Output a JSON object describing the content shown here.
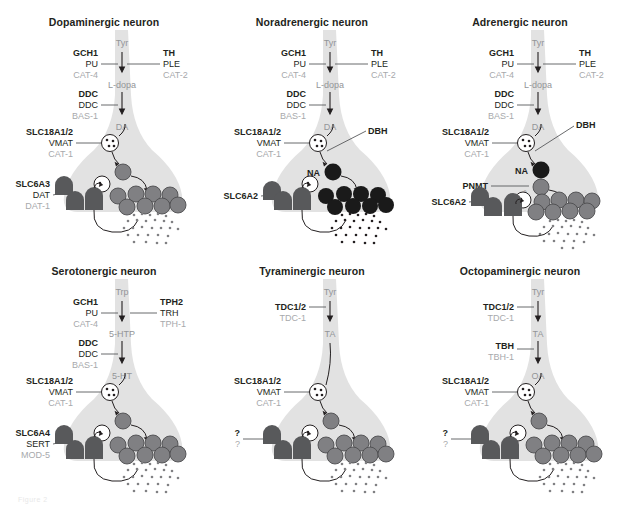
{
  "figure": {
    "caption_fragment": "Figure 2",
    "colors": {
      "neuron_fill": "#e0e0e0",
      "neuron_fill_light": "#e8e8e8",
      "vesicle_gray": "#808083",
      "vesicle_dark": "#1a1a1a",
      "transporter": "#58595b",
      "text_black": "#231f20",
      "text_gray": "#a7a9ac",
      "metabolite_gray": "#939598"
    }
  },
  "panels": [
    {
      "id": "dopaminergic",
      "title": "Dopaminergic neuron",
      "metabolites": [
        {
          "name": "Tyr",
          "style": "gray"
        },
        {
          "name": "L-dopa",
          "style": "gray"
        },
        {
          "name": "DA",
          "style": "gray"
        }
      ],
      "enzymes_left": [
        {
          "gene": "GCH1",
          "protein": "PU",
          "ortholog": "CAT-4"
        },
        {
          "gene": "DDC",
          "protein": "DDC",
          "ortholog": "BAS-1"
        }
      ],
      "enzymes_right": [
        {
          "gene": "TH",
          "protein": "PLE",
          "ortholog": "CAT-2"
        }
      ],
      "vmat": {
        "gene": "SLC18A1/2",
        "protein": "VMAT",
        "ortholog": "CAT-1"
      },
      "transporter": {
        "gene": "SLC6A3",
        "protein": "DAT",
        "ortholog": "DAT-1"
      },
      "vesicle_color": "gray",
      "terminal_metabolite": null,
      "extra_enzyme": null
    },
    {
      "id": "noradrenergic",
      "title": "Noradrenergic neuron",
      "metabolites": [
        {
          "name": "Tyr",
          "style": "gray"
        },
        {
          "name": "L-dopa",
          "style": "gray"
        },
        {
          "name": "DA",
          "style": "gray"
        }
      ],
      "enzymes_left": [
        {
          "gene": "GCH1",
          "protein": "PU",
          "ortholog": "CAT-4"
        },
        {
          "gene": "DDC",
          "protein": "DDC",
          "ortholog": "BAS-1"
        }
      ],
      "enzymes_right": [
        {
          "gene": "TH",
          "protein": "PLE",
          "ortholog": "CAT-2"
        }
      ],
      "vmat": {
        "gene": "SLC18A1/2",
        "protein": "VMAT",
        "ortholog": "CAT-1"
      },
      "transporter": {
        "gene": "SLC6A2",
        "protein": "",
        "ortholog": ""
      },
      "vesicle_color": "dark",
      "terminal_metabolite": "NA",
      "extra_enzyme": "DBH"
    },
    {
      "id": "adrenergic",
      "title": "Adrenergic neuron",
      "metabolites": [
        {
          "name": "Tyr",
          "style": "gray"
        },
        {
          "name": "L-dopa",
          "style": "gray"
        },
        {
          "name": "DA",
          "style": "gray"
        }
      ],
      "enzymes_left": [
        {
          "gene": "GCH1",
          "protein": "PU",
          "ortholog": "CAT-4"
        },
        {
          "gene": "DDC",
          "protein": "DDC",
          "ortholog": "BAS-1"
        }
      ],
      "enzymes_right": [
        {
          "gene": "TH",
          "protein": "PLE",
          "ortholog": "CAT-2"
        }
      ],
      "vmat": {
        "gene": "SLC18A1/2",
        "protein": "VMAT",
        "ortholog": "CAT-1"
      },
      "transporter": {
        "gene": "SLC6A2",
        "protein": "",
        "ortholog": ""
      },
      "vesicle_color": "gray",
      "terminal_metabolite": "NA",
      "terminal_metabolite_2": "A",
      "extra_enzyme": "DBH",
      "extra_enzyme_2": "PNMT"
    },
    {
      "id": "serotonergic",
      "title": "Serotonergic neuron",
      "metabolites": [
        {
          "name": "Trp",
          "style": "gray"
        },
        {
          "name": "5-HTP",
          "style": "gray"
        },
        {
          "name": "5-HT",
          "style": "gray"
        }
      ],
      "enzymes_left": [
        {
          "gene": "GCH1",
          "protein": "PU",
          "ortholog": "CAT-4"
        },
        {
          "gene": "DDC",
          "protein": "DDC",
          "ortholog": "BAS-1"
        }
      ],
      "enzymes_right": [
        {
          "gene": "TPH2",
          "protein": "TRH",
          "ortholog": "TPH-1"
        }
      ],
      "vmat": {
        "gene": "SLC18A1/2",
        "protein": "VMAT",
        "ortholog": "CAT-1"
      },
      "transporter": {
        "gene": "SLC6A4",
        "protein": "SERT",
        "ortholog": "MOD-5"
      },
      "vesicle_color": "gray",
      "terminal_metabolite": null,
      "extra_enzyme": null
    },
    {
      "id": "tyraminergic",
      "title": "Tyraminergic neuron",
      "metabolites": [
        {
          "name": "Tyr",
          "style": "gray"
        },
        {
          "name": "TA",
          "style": "gray"
        }
      ],
      "enzymes_left": [
        {
          "gene": "TDC1/2",
          "protein": "",
          "ortholog": "TDC-1"
        }
      ],
      "enzymes_right": [],
      "vmat": {
        "gene": "SLC18A1/2",
        "protein": "VMAT",
        "ortholog": "CAT-1"
      },
      "transporter": {
        "gene": "?",
        "protein": "",
        "ortholog": "?"
      },
      "vesicle_color": "gray",
      "terminal_metabolite": null,
      "extra_enzyme": null
    },
    {
      "id": "octopaminergic",
      "title": "Octopaminergic neuron",
      "metabolites": [
        {
          "name": "Tyr",
          "style": "gray"
        },
        {
          "name": "TA",
          "style": "gray"
        },
        {
          "name": "OA",
          "style": "gray"
        }
      ],
      "enzymes_left": [
        {
          "gene": "TDC1/2",
          "protein": "",
          "ortholog": "TDC-1"
        },
        {
          "gene": "TBH",
          "protein": "",
          "ortholog": "TBH-1"
        }
      ],
      "enzymes_right": [],
      "vmat": {
        "gene": "SLC18A1/2",
        "protein": "VMAT",
        "ortholog": "CAT-1"
      },
      "transporter": {
        "gene": "?",
        "protein": "",
        "ortholog": "?"
      },
      "vesicle_color": "gray",
      "terminal_metabolite": null,
      "extra_enzyme": null
    }
  ]
}
